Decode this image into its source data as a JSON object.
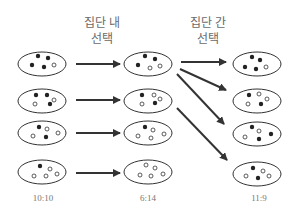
{
  "headings": {
    "within": {
      "line1": "집단 내",
      "line2": "선택"
    },
    "between": {
      "line1": "집단 간",
      "line2": "선택"
    }
  },
  "columns": [
    {
      "ratio": "10:10",
      "groups": [
        {
          "black": 4,
          "white": 1
        },
        {
          "black": 3,
          "white": 2
        },
        {
          "black": 2,
          "white": 3
        },
        {
          "black": 1,
          "white": 4
        }
      ]
    },
    {
      "ratio": "6:14",
      "groups": [
        {
          "black": 3,
          "white": 2
        },
        {
          "black": 2,
          "white": 3
        },
        {
          "black": 1,
          "white": 4
        },
        {
          "black": 0,
          "white": 5
        }
      ]
    },
    {
      "ratio": "11:9",
      "groups": [
        {
          "black": 4,
          "white": 1
        },
        {
          "black": 2,
          "white": 3
        },
        {
          "black": 3,
          "white": 2
        },
        {
          "black": 2,
          "white": 3
        }
      ]
    }
  ],
  "arrows": {
    "within": [
      "L1->M1",
      "L2->M2",
      "L3->M3",
      "L4->M4"
    ],
    "between": [
      "M1->R1",
      "M1->R2",
      "M1->R3",
      "M2->R4"
    ]
  },
  "colors": {
    "stroke": "#333333",
    "text": "#6a6a6a"
  }
}
